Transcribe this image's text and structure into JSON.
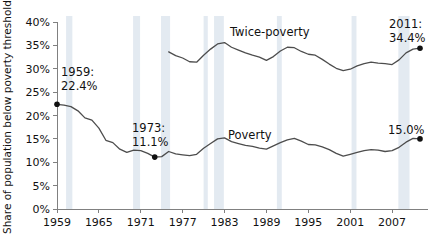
{
  "chart_data": {
    "type": "line",
    "title": "",
    "xlabel": "",
    "ylabel": "Share of population below poverty threshold",
    "xlim": [
      1959,
      2011
    ],
    "ylim": [
      0,
      40
    ],
    "grid": false,
    "legend_position": "inline-labels",
    "y_ticks": [
      "0%",
      "5%",
      "10%",
      "15%",
      "20%",
      "25%",
      "30%",
      "35%",
      "40%"
    ],
    "y_tick_values": [
      0,
      5,
      10,
      15,
      20,
      25,
      30,
      35,
      40
    ],
    "x_ticks": [
      "1959",
      "1965",
      "1971",
      "1977",
      "1983",
      "1989",
      "1995",
      "2001",
      "2007"
    ],
    "x_tick_values": [
      1959,
      1965,
      1971,
      1977,
      1983,
      1989,
      1995,
      2001,
      2007
    ],
    "x": [
      1959,
      1960,
      1961,
      1962,
      1963,
      1964,
      1965,
      1966,
      1967,
      1968,
      1969,
      1970,
      1971,
      1972,
      1973,
      1974,
      1975,
      1976,
      1977,
      1978,
      1979,
      1980,
      1981,
      1982,
      1983,
      1984,
      1985,
      1986,
      1987,
      1988,
      1989,
      1990,
      1991,
      1992,
      1993,
      1994,
      1995,
      1996,
      1997,
      1998,
      1999,
      2000,
      2001,
      2002,
      2003,
      2004,
      2005,
      2006,
      2007,
      2008,
      2009,
      2010,
      2011
    ],
    "series": [
      {
        "name": "Twice-poverty",
        "label": "Twice-poverty",
        "values": [
          null,
          null,
          null,
          null,
          null,
          null,
          null,
          null,
          null,
          null,
          null,
          null,
          null,
          null,
          null,
          null,
          33.6,
          32.8,
          32.3,
          31.5,
          31.4,
          32.9,
          34.2,
          35.3,
          35.6,
          34.6,
          34.0,
          33.4,
          32.9,
          32.5,
          31.8,
          32.6,
          33.8,
          34.6,
          34.5,
          33.7,
          33.1,
          32.9,
          32.0,
          31.0,
          30.1,
          29.6,
          29.9,
          30.6,
          31.1,
          31.4,
          31.2,
          31.1,
          30.9,
          31.9,
          33.4,
          34.2,
          34.4
        ]
      },
      {
        "name": "Poverty",
        "label": "Poverty",
        "values": [
          22.4,
          22.2,
          21.9,
          21.0,
          19.5,
          19.0,
          17.3,
          14.7,
          14.2,
          12.8,
          12.1,
          12.6,
          12.5,
          11.9,
          11.1,
          11.2,
          12.3,
          11.8,
          11.6,
          11.4,
          11.7,
          13.0,
          14.0,
          15.0,
          15.2,
          14.4,
          14.0,
          13.6,
          13.4,
          13.0,
          12.8,
          13.5,
          14.2,
          14.8,
          15.1,
          14.5,
          13.8,
          13.7,
          13.3,
          12.7,
          11.9,
          11.3,
          11.7,
          12.1,
          12.5,
          12.7,
          12.6,
          12.3,
          12.5,
          13.2,
          14.3,
          15.1,
          15.0
        ]
      }
    ],
    "annotations": [
      {
        "id": "a1959",
        "line1": "1959:",
        "line2": "22.4%",
        "x": 1959,
        "y": 22.4,
        "marker": true
      },
      {
        "id": "a1973",
        "line1": "1973:",
        "line2": "11.1%",
        "x": 1973,
        "y": 11.1,
        "marker": true
      },
      {
        "id": "a2011_twice",
        "line1": "2011:",
        "line2": "34.4%",
        "x": 2011,
        "y": 34.4,
        "marker": true
      },
      {
        "id": "a2011_pov",
        "line1": "",
        "line2": "15.0%",
        "x": 2011,
        "y": 15.0,
        "marker": true
      }
    ],
    "recession_bands": [
      {
        "start": 1960.3,
        "end": 1961.2
      },
      {
        "start": 1969.9,
        "end": 1970.9
      },
      {
        "start": 1973.9,
        "end": 1975.2
      },
      {
        "start": 1980.0,
        "end": 1980.6
      },
      {
        "start": 1981.5,
        "end": 1982.9
      },
      {
        "start": 1990.5,
        "end": 1991.2
      },
      {
        "start": 2001.2,
        "end": 2001.9
      },
      {
        "start": 2007.9,
        "end": 2009.5
      }
    ]
  }
}
